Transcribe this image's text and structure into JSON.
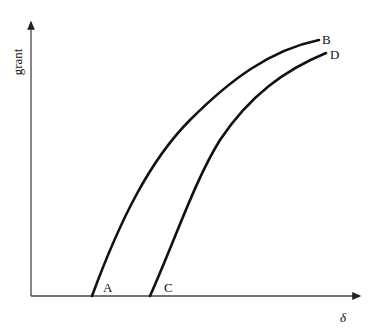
{
  "axes": {
    "y_label": "grant",
    "x_label": "δ"
  },
  "curves": [
    {
      "name": "AB",
      "start_label": "A",
      "end_label": "B"
    },
    {
      "name": "CD",
      "start_label": "C",
      "end_label": "D"
    }
  ],
  "colors": {
    "line": "#111111",
    "axis": "#444444",
    "background": "#ffffff"
  }
}
